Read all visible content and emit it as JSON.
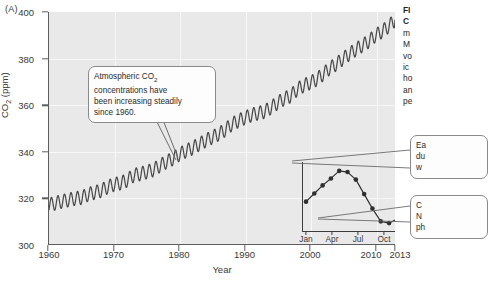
{
  "panel": {
    "label": "(A)"
  },
  "chart_data": {
    "type": "line",
    "xlabel": "Year",
    "ylabel": "CO2 (ppm)",
    "ylabel_display": "CO",
    "ylabel_sub": "2",
    "ylabel_unit": " (ppm)",
    "xlim": [
      1960,
      2013
    ],
    "ylim": [
      300,
      400
    ],
    "ytick_values": [
      300,
      320,
      340,
      360,
      380,
      400
    ],
    "ytick_labels": [
      "300",
      "320",
      "340",
      "360",
      "380",
      "400"
    ],
    "xtick_values": [
      1960,
      1970,
      1980,
      1990,
      2000,
      2010,
      2013
    ],
    "xtick_labels": [
      "1960",
      "1970",
      "1980",
      "1990",
      "2000",
      "2010",
      "2013"
    ],
    "grid": true,
    "legend": "none",
    "series": [
      {
        "name": "Monthly mean CO2 (ppm)",
        "description": "Steadily rising trend with annual sawtooth seasonal oscillation of about 6 ppm amplitude",
        "x": [
          1960,
          1961,
          1962,
          1963,
          1964,
          1965,
          1966,
          1967,
          1968,
          1969,
          1970,
          1971,
          1972,
          1973,
          1974,
          1975,
          1976,
          1977,
          1978,
          1979,
          1980,
          1981,
          1982,
          1983,
          1984,
          1985,
          1986,
          1987,
          1988,
          1989,
          1990,
          1991,
          1992,
          1993,
          1994,
          1995,
          1996,
          1997,
          1998,
          1999,
          2000,
          2001,
          2002,
          2003,
          2004,
          2005,
          2006,
          2007,
          2008,
          2009,
          2010,
          2011,
          2012,
          2013
        ],
        "values": [
          316.9,
          317.6,
          318.4,
          319.0,
          319.6,
          320.0,
          321.4,
          322.2,
          323.0,
          324.6,
          325.7,
          326.3,
          327.5,
          329.7,
          330.2,
          331.1,
          332.0,
          333.8,
          335.4,
          336.8,
          338.7,
          340.1,
          341.4,
          343.0,
          344.6,
          346.0,
          347.4,
          349.2,
          351.6,
          353.1,
          354.4,
          355.6,
          356.4,
          357.1,
          358.8,
          360.8,
          362.6,
          363.8,
          366.6,
          368.3,
          369.5,
          371.0,
          373.2,
          375.8,
          377.5,
          379.8,
          381.9,
          383.8,
          385.6,
          387.4,
          389.9,
          391.6,
          393.8,
          396.5
        ]
      }
    ],
    "inset": {
      "type": "line",
      "title": "Seasonal cycle of CO2 within a single year",
      "xtick_labels": [
        "Jan",
        "Apr",
        "Jul",
        "Oct",
        "Jan"
      ],
      "marker": "filled-circle",
      "months": [
        "Jan",
        "Feb",
        "Mar",
        "Apr",
        "May",
        "Jun",
        "Jul",
        "Aug",
        "Sep",
        "Oct",
        "Nov",
        "Dec",
        "Jan",
        "Feb"
      ],
      "relative_values": [
        0.42,
        0.56,
        0.7,
        0.82,
        0.95,
        0.93,
        0.8,
        0.55,
        0.3,
        0.08,
        0.05,
        0.12,
        0.3,
        0.45
      ],
      "peak_month": "May",
      "trough_month": "Oct"
    }
  },
  "callouts": {
    "main": {
      "line1_pre": "Atmospheric CO",
      "line1_sub": "2",
      "line2": "concentrations have",
      "line3": "been increasing steadily",
      "line4": "since 1960."
    },
    "right_upper": {
      "line1": "Ea",
      "line2": "du",
      "line3": "w"
    },
    "right_lower": {
      "line1": "C",
      "line2": "N",
      "line3": "ph"
    }
  },
  "caption": {
    "head_line1": "FI",
    "head_line2": "C",
    "body_line1": "m",
    "body_line2": "M",
    "body_line3": "vo",
    "body_line4": "ic",
    "body_line5": "ho",
    "body_line6": "an",
    "body_line7": "pe"
  },
  "colors": {
    "plot_background": "#e9e9e9",
    "gridline": "#f7f7f7",
    "axis": "#5d5d5d",
    "curve": "#4a4a4a",
    "inset_marker": "#2f2f2f",
    "callout_border": "#8a8a8a",
    "callout_fill": "#fdfdfd",
    "text": "#2b2b2b"
  }
}
